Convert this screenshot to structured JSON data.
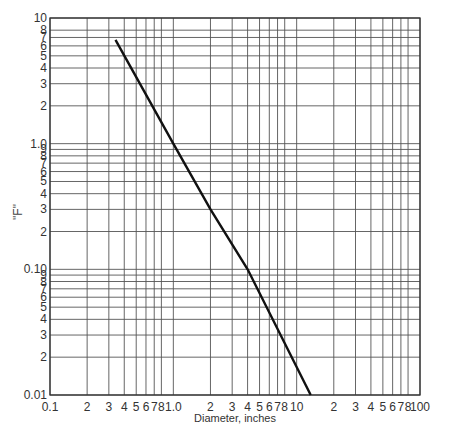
{
  "chart_data": {
    "type": "line",
    "title": "",
    "xlabel": "Diameter, inches",
    "ylabel": "\"F\"",
    "xscale": "log",
    "yscale": "log",
    "xlim": [
      0.1,
      100
    ],
    "ylim": [
      0.01,
      10
    ],
    "grid": true,
    "legend": null,
    "x_tick_labels": [
      {
        "v": 0.1,
        "t": "0.1"
      },
      {
        "v": 0.2,
        "t": "2"
      },
      {
        "v": 0.3,
        "t": "3"
      },
      {
        "v": 0.4,
        "t": "4"
      },
      {
        "v": 0.5,
        "t": "5"
      },
      {
        "v": 0.6,
        "t": "6"
      },
      {
        "v": 0.7,
        "t": "7"
      },
      {
        "v": 0.8,
        "t": "8"
      },
      {
        "v": 1.0,
        "t": "1.0"
      },
      {
        "v": 2,
        "t": "2"
      },
      {
        "v": 3,
        "t": "3"
      },
      {
        "v": 4,
        "t": "4"
      },
      {
        "v": 5,
        "t": "5"
      },
      {
        "v": 6,
        "t": "6"
      },
      {
        "v": 7,
        "t": "7"
      },
      {
        "v": 8,
        "t": "8"
      },
      {
        "v": 10,
        "t": "10"
      },
      {
        "v": 20,
        "t": "2"
      },
      {
        "v": 30,
        "t": "3"
      },
      {
        "v": 40,
        "t": "4"
      },
      {
        "v": 50,
        "t": "5"
      },
      {
        "v": 60,
        "t": "6"
      },
      {
        "v": 70,
        "t": "7"
      },
      {
        "v": 80,
        "t": "8"
      },
      {
        "v": 100,
        "t": "100"
      }
    ],
    "y_tick_labels": [
      {
        "v": 10,
        "t": "10"
      },
      {
        "v": 8,
        "t": "8"
      },
      {
        "v": 7,
        "t": "7"
      },
      {
        "v": 6,
        "t": "6"
      },
      {
        "v": 5,
        "t": "5"
      },
      {
        "v": 4,
        "t": "4"
      },
      {
        "v": 3,
        "t": "3"
      },
      {
        "v": 2,
        "t": "2"
      },
      {
        "v": 1.0,
        "t": "1.0"
      },
      {
        "v": 0.9,
        "t": "9"
      },
      {
        "v": 0.8,
        "t": "8"
      },
      {
        "v": 0.7,
        "t": "7"
      },
      {
        "v": 0.6,
        "t": "6"
      },
      {
        "v": 0.5,
        "t": "5"
      },
      {
        "v": 0.4,
        "t": "4"
      },
      {
        "v": 0.3,
        "t": "3"
      },
      {
        "v": 0.2,
        "t": "2"
      },
      {
        "v": 0.1,
        "t": "0.10"
      },
      {
        "v": 0.09,
        "t": "9"
      },
      {
        "v": 0.08,
        "t": "8"
      },
      {
        "v": 0.07,
        "t": "7"
      },
      {
        "v": 0.06,
        "t": "6"
      },
      {
        "v": 0.05,
        "t": "5"
      },
      {
        "v": 0.04,
        "t": "4"
      },
      {
        "v": 0.03,
        "t": "3"
      },
      {
        "v": 0.02,
        "t": "2"
      },
      {
        "v": 0.01,
        "t": "0.01"
      }
    ],
    "series": [
      {
        "name": "F vs Diameter",
        "color": "#111111",
        "x": [
          0.34,
          1.0,
          2.0,
          4.0,
          13.0
        ],
        "y": [
          6.7,
          1.0,
          0.3,
          0.1,
          0.01
        ]
      }
    ]
  },
  "caption": "— partially visible caption text (cut off) —"
}
